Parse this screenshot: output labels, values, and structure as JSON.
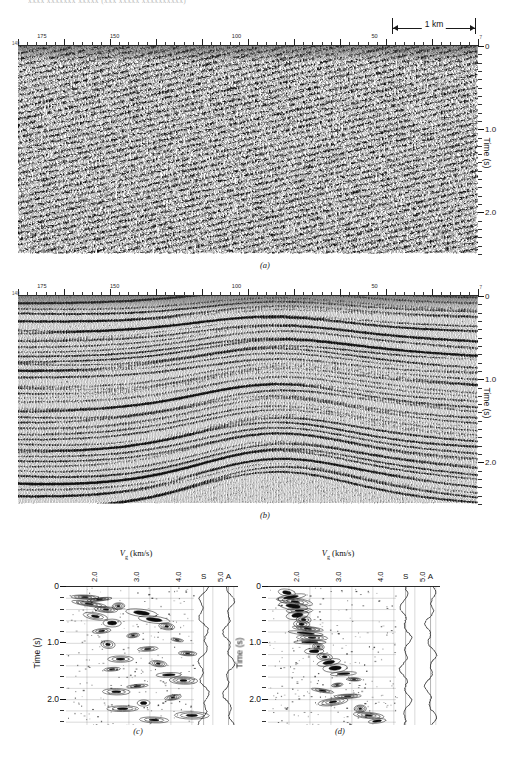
{
  "running_header": "xxxx xxxxxxx xxxxx  (xxx xxxxx xxxxxxxxxx)",
  "figure": {
    "panels": [
      {
        "id": "a",
        "caption": "(a)"
      },
      {
        "id": "b",
        "caption": "(b)"
      },
      {
        "id": "c",
        "caption": "(c)"
      },
      {
        "id": "d",
        "caption": "(d)"
      }
    ]
  },
  "seismic": {
    "shot_axis": {
      "labels": [
        "175",
        "150",
        "100",
        "50"
      ],
      "label_positions_pct": [
        5.2,
        21.0,
        47.5,
        77.5
      ],
      "left_edge_number": "140",
      "right_edge_number": "7"
    },
    "time_axis": {
      "title": "Time (s)",
      "ticks": [
        "0",
        "1.0",
        "2.0"
      ],
      "tick_values": [
        0,
        1.0,
        2.0
      ],
      "range_s": [
        0,
        2.5
      ],
      "minor_interval_s": 0.1
    },
    "scale_bar": {
      "label": "1 km"
    }
  },
  "velocity": {
    "title_prefix": "V",
    "title_sub": "g",
    "title_units": "(km/s)",
    "x_ticks": [
      "2.0",
      "3.0",
      "4.0",
      "5.0"
    ],
    "x_tick_values": [
      2.0,
      3.0,
      4.0,
      5.0
    ],
    "x_range": [
      1.5,
      5.6
    ],
    "trace_labels": [
      "S",
      "A"
    ],
    "y_title": "Time (s)",
    "y_ticks": [
      "0",
      "1.0",
      "2.0"
    ],
    "y_tick_values": [
      0,
      1.0,
      2.0
    ],
    "y_range_s": [
      0,
      2.45
    ],
    "y_minor_interval_s": 0.2
  },
  "chart_data": {
    "type": "heatmap",
    "subplots": [
      {
        "id": "a",
        "kind": "seismic-section",
        "description": "Unmigrated stacked seismic section, incoherent noisy wiggle-trace variable-area display",
        "xlabel": "Shotpoint number",
        "ylabel": "Time (s)",
        "xticks": [
          175,
          150,
          100,
          50
        ],
        "yticks": [
          0,
          1.0,
          2.0
        ],
        "ylim": [
          0,
          2.5
        ],
        "coherence": 0.15,
        "dominant_frequency_hz": 28
      },
      {
        "id": "b",
        "kind": "seismic-section",
        "description": "Processed/migrated seismic section with strongly coherent continuous reflectors forming an anticline",
        "xlabel": "Shotpoint number",
        "ylabel": "Time (s)",
        "xticks": [
          175,
          150,
          100,
          50
        ],
        "yticks": [
          0,
          1.0,
          2.0
        ],
        "ylim": [
          0,
          2.5
        ],
        "coherence": 0.9,
        "dominant_frequency_hz": 24
      },
      {
        "id": "c",
        "kind": "velocity-semblance",
        "description": "Velocity spectrum contours with scattered semblance maxima, S and A summation traces",
        "xlabel": "Vg (km/s)",
        "ylabel": "Time (s)",
        "xticks": [
          2.0,
          3.0,
          4.0,
          5.0
        ],
        "xlim": [
          1.5,
          5.6
        ],
        "yticks": [
          0,
          1.0,
          2.0
        ],
        "ylim": [
          0,
          2.45
        ],
        "picks": [
          {
            "t": 0.18,
            "v": 1.95
          },
          {
            "t": 0.22,
            "v": 2.3
          },
          {
            "t": 0.3,
            "v": 2.05
          },
          {
            "t": 0.34,
            "v": 2.75
          },
          {
            "t": 0.4,
            "v": 2.45
          },
          {
            "t": 0.46,
            "v": 3.3
          },
          {
            "t": 0.52,
            "v": 2.2
          },
          {
            "t": 0.58,
            "v": 3.6
          },
          {
            "t": 0.64,
            "v": 2.6
          },
          {
            "t": 0.7,
            "v": 3.9
          },
          {
            "t": 0.78,
            "v": 2.35
          },
          {
            "t": 0.86,
            "v": 3.1
          },
          {
            "t": 0.94,
            "v": 4.15
          },
          {
            "t": 1.02,
            "v": 2.5
          },
          {
            "t": 1.1,
            "v": 3.45
          },
          {
            "t": 1.18,
            "v": 4.4
          },
          {
            "t": 1.28,
            "v": 2.8
          },
          {
            "t": 1.36,
            "v": 3.7
          },
          {
            "t": 1.46,
            "v": 2.6
          },
          {
            "t": 1.56,
            "v": 3.95
          },
          {
            "t": 1.66,
            "v": 4.3
          },
          {
            "t": 1.76,
            "v": 3.2
          },
          {
            "t": 1.86,
            "v": 2.7
          },
          {
            "t": 1.96,
            "v": 4.05
          },
          {
            "t": 2.06,
            "v": 3.35
          },
          {
            "t": 2.16,
            "v": 2.85
          },
          {
            "t": 2.28,
            "v": 4.5
          },
          {
            "t": 2.36,
            "v": 3.6
          }
        ]
      },
      {
        "id": "d",
        "kind": "velocity-semblance",
        "description": "Velocity spectrum contours concentrated at low velocities, S and A summation traces",
        "xlabel": "Vg (km/s)",
        "ylabel": "Time (s)",
        "xticks": [
          2.0,
          3.0,
          4.0,
          5.0
        ],
        "xlim": [
          1.5,
          5.6
        ],
        "yticks": [
          0,
          1.0,
          2.0
        ],
        "ylim": [
          0,
          2.45
        ],
        "picks": [
          {
            "t": 0.1,
            "v": 1.95
          },
          {
            "t": 0.18,
            "v": 2.05
          },
          {
            "t": 0.26,
            "v": 2.15
          },
          {
            "t": 0.34,
            "v": 2.1
          },
          {
            "t": 0.42,
            "v": 2.25
          },
          {
            "t": 0.5,
            "v": 2.2
          },
          {
            "t": 0.58,
            "v": 2.35
          },
          {
            "t": 0.66,
            "v": 2.3
          },
          {
            "t": 0.74,
            "v": 2.45
          },
          {
            "t": 0.82,
            "v": 2.4
          },
          {
            "t": 0.9,
            "v": 2.55
          },
          {
            "t": 0.98,
            "v": 2.5
          },
          {
            "t": 1.06,
            "v": 2.7
          },
          {
            "t": 1.14,
            "v": 2.6
          },
          {
            "t": 1.24,
            "v": 2.85
          },
          {
            "t": 1.34,
            "v": 2.95
          },
          {
            "t": 1.44,
            "v": 3.1
          },
          {
            "t": 1.54,
            "v": 3.3
          },
          {
            "t": 1.64,
            "v": 3.55
          },
          {
            "t": 1.74,
            "v": 3.15
          },
          {
            "t": 1.84,
            "v": 2.8
          },
          {
            "t": 1.94,
            "v": 3.4
          },
          {
            "t": 2.04,
            "v": 3.05
          },
          {
            "t": 2.16,
            "v": 3.7
          },
          {
            "t": 2.28,
            "v": 3.9
          },
          {
            "t": 2.38,
            "v": 4.1
          }
        ]
      }
    ]
  }
}
